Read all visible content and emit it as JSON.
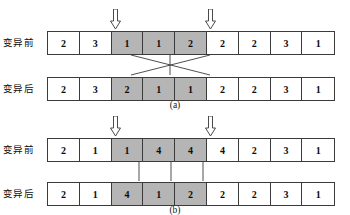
{
  "figure": {
    "label_before": "变异前",
    "label_after": "变异后",
    "arrow_icon": "down-block-arrow-icon",
    "shaded_color": "#b5b5b5",
    "border_color": "#3b3b3b",
    "cell_count": 9,
    "panels": [
      {
        "id": "a",
        "caption": "(a)",
        "marker_positions": [
          2,
          5
        ],
        "segment_range": [
          2,
          4
        ],
        "connector_style": "crossed",
        "rows": [
          {
            "name": "before",
            "label": "变异前",
            "values": [
              "2",
              "3",
              "1",
              "1",
              "2",
              "2",
              "2",
              "3",
              "1"
            ],
            "shaded": [
              false,
              false,
              true,
              true,
              true,
              false,
              false,
              false,
              false
            ]
          },
          {
            "name": "after",
            "label": "变异后",
            "values": [
              "2",
              "3",
              "2",
              "1",
              "1",
              "2",
              "2",
              "3",
              "1"
            ],
            "shaded": [
              false,
              false,
              true,
              true,
              true,
              false,
              false,
              false,
              false
            ]
          }
        ]
      },
      {
        "id": "b",
        "caption": "(b)",
        "marker_positions": [
          2,
          5
        ],
        "segment_range": [
          2,
          4
        ],
        "connector_style": "vertical",
        "rows": [
          {
            "name": "before",
            "label": "变异前",
            "values": [
              "2",
              "1",
              "1",
              "4",
              "4",
              "4",
              "2",
              "3",
              "1"
            ],
            "shaded": [
              false,
              false,
              true,
              true,
              true,
              false,
              false,
              false,
              false
            ]
          },
          {
            "name": "after",
            "label": "变异后",
            "values": [
              "2",
              "1",
              "4",
              "1",
              "2",
              "2",
              "2",
              "3",
              "1"
            ],
            "shaded": [
              false,
              false,
              true,
              true,
              true,
              false,
              false,
              false,
              false
            ]
          }
        ]
      }
    ]
  }
}
